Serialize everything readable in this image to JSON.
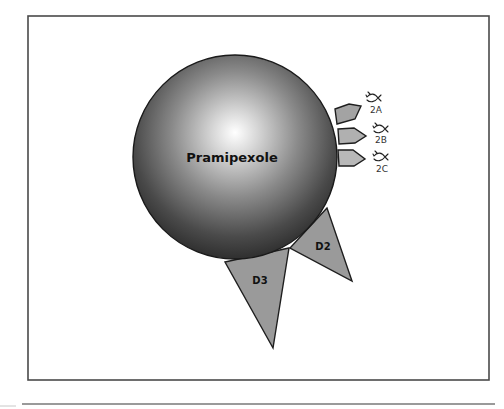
{
  "diagram": {
    "drug": {
      "label": "Pramipexole",
      "center": [
        235,
        157
      ],
      "radius": 102
    },
    "receptors": {
      "dopamine": [
        {
          "id": "D3",
          "label": "D3",
          "color": "#9a9a9a",
          "points": "225,262 289,248 273,348",
          "label_pos": [
            260,
            284
          ]
        },
        {
          "id": "D2",
          "label": "D2",
          "color": "#9a9a9a",
          "points": "327,208 290,248 352,281",
          "label_pos": [
            323,
            250
          ]
        }
      ],
      "serotonin": [
        {
          "id": "2A",
          "label": "2A",
          "color": "#a3a3a3",
          "points": "335,109 349,104 361,106 355,119 337,124",
          "icon_pos": [
            372,
            97
          ],
          "label_pos": [
            376,
            113
          ]
        },
        {
          "id": "2B",
          "label": "2B",
          "color": "#b0b0b0",
          "points": "338,129 354,128 366,136 355,143 339,144",
          "icon_pos": [
            379,
            128
          ],
          "label_pos": [
            381,
            143
          ]
        },
        {
          "id": "2C",
          "label": "2C",
          "color": "#b8b8b8",
          "points": "338,150 353,150 365,159 354,166 339,166",
          "icon_pos": [
            379,
            156
          ],
          "label_pos": [
            382,
            172
          ]
        }
      ]
    },
    "colors": {
      "sphere_highlight": "#ffffff",
      "sphere_mid": "#8a8a8a",
      "sphere_dark": "#2a2a2a",
      "frame": "#4a4a4a",
      "rule": "#9a9a9a"
    }
  }
}
